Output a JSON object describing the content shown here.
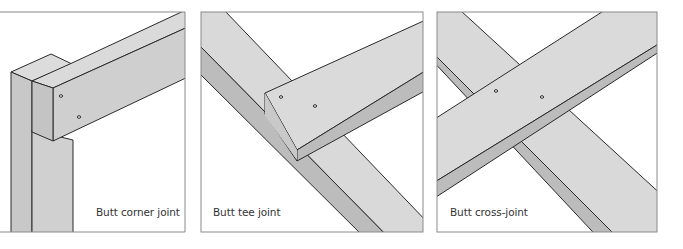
{
  "figure": {
    "panels": [
      {
        "id": "corner",
        "caption": "Butt corner joint"
      },
      {
        "id": "tee",
        "caption": "Butt tee joint"
      },
      {
        "id": "cross",
        "caption": "Butt cross-joint"
      }
    ],
    "colors": {
      "face_light": "#d9d9d9",
      "face_mid": "#cfcfcf",
      "face_dark": "#b8b8b8",
      "outline": "#2a2a2a",
      "frame": "#8a8a8a",
      "text": "#333333"
    }
  }
}
